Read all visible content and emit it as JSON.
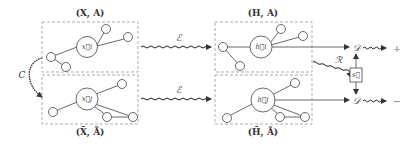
{
  "diagram": {
    "type": "contrastive-graph-learning-pipeline",
    "views": [
      {
        "id": "original",
        "pair_label": "(X, A)",
        "node_label": "x⃗i"
      },
      {
        "id": "augmented",
        "pair_label": "(X̃, Ã)",
        "node_label": "x⃗j"
      }
    ],
    "encoded": [
      {
        "id": "original",
        "pair_label": "(H, A)",
        "node_label": "h⃗i"
      },
      {
        "id": "augmented",
        "pair_label": "(H̃, Ã)",
        "node_label": "h⃗j"
      }
    ],
    "edges": {
      "corruption": "C",
      "encoder_top": "ℰ",
      "encoder_bottom": "ℰ",
      "readout": "ℛ",
      "discriminator_top": "𝒟",
      "discriminator_bottom": "𝒟"
    },
    "summary_node": "s⃗",
    "outputs": {
      "positive": "+",
      "negative": "−"
    },
    "colors": {
      "stroke": "#444444",
      "dashed_box": "#9a9a9a",
      "background": "#ffffff"
    }
  }
}
